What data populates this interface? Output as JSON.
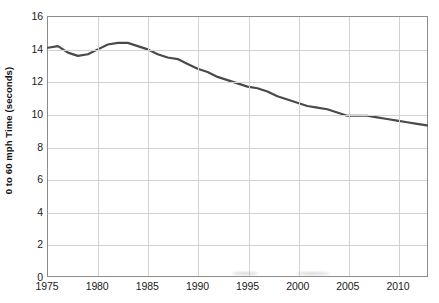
{
  "chart_data": {
    "type": "line",
    "title": "",
    "xlabel": "",
    "ylabel": "0 to 60 mph Time (seconds)",
    "xlim": [
      1975,
      2013
    ],
    "ylim": [
      0,
      16
    ],
    "grid": true,
    "legend": "none",
    "line_color": "#4a4a4a",
    "x_tick_labels": [
      "1975",
      "1980",
      "1985",
      "1990",
      "1995",
      "2000",
      "2005",
      "2010"
    ],
    "x_ticks": [
      1975,
      1980,
      1985,
      1990,
      1995,
      2000,
      2005,
      2010
    ],
    "y_tick_labels": [
      "0",
      "2",
      "4",
      "6",
      "8",
      "10",
      "12",
      "14",
      "16"
    ],
    "y_ticks": [
      0,
      2,
      4,
      6,
      8,
      10,
      12,
      14,
      16
    ],
    "x": [
      1975,
      1976,
      1977,
      1978,
      1979,
      1980,
      1981,
      1982,
      1983,
      1984,
      1985,
      1986,
      1987,
      1988,
      1989,
      1990,
      1991,
      1992,
      1993,
      1994,
      1995,
      1996,
      1997,
      1998,
      1999,
      2000,
      2001,
      2002,
      2003,
      2004,
      2005,
      2006,
      2007,
      2008,
      2009,
      2010,
      2011,
      2012,
      2013
    ],
    "values": [
      14.1,
      14.2,
      13.8,
      13.6,
      13.7,
      14.0,
      14.3,
      14.4,
      14.4,
      14.2,
      14.0,
      13.7,
      13.5,
      13.4,
      13.1,
      12.8,
      12.6,
      12.3,
      12.1,
      11.9,
      11.7,
      11.6,
      11.4,
      11.1,
      10.9,
      10.7,
      10.5,
      10.4,
      10.3,
      10.1,
      9.9,
      9.9,
      9.9,
      9.8,
      9.7,
      9.6,
      9.5,
      9.4,
      9.3
    ]
  },
  "artifacts": {
    "smudges": [
      {
        "x": 232,
        "y": 272,
        "w": 26
      },
      {
        "x": 296,
        "y": 272,
        "w": 34
      }
    ]
  }
}
